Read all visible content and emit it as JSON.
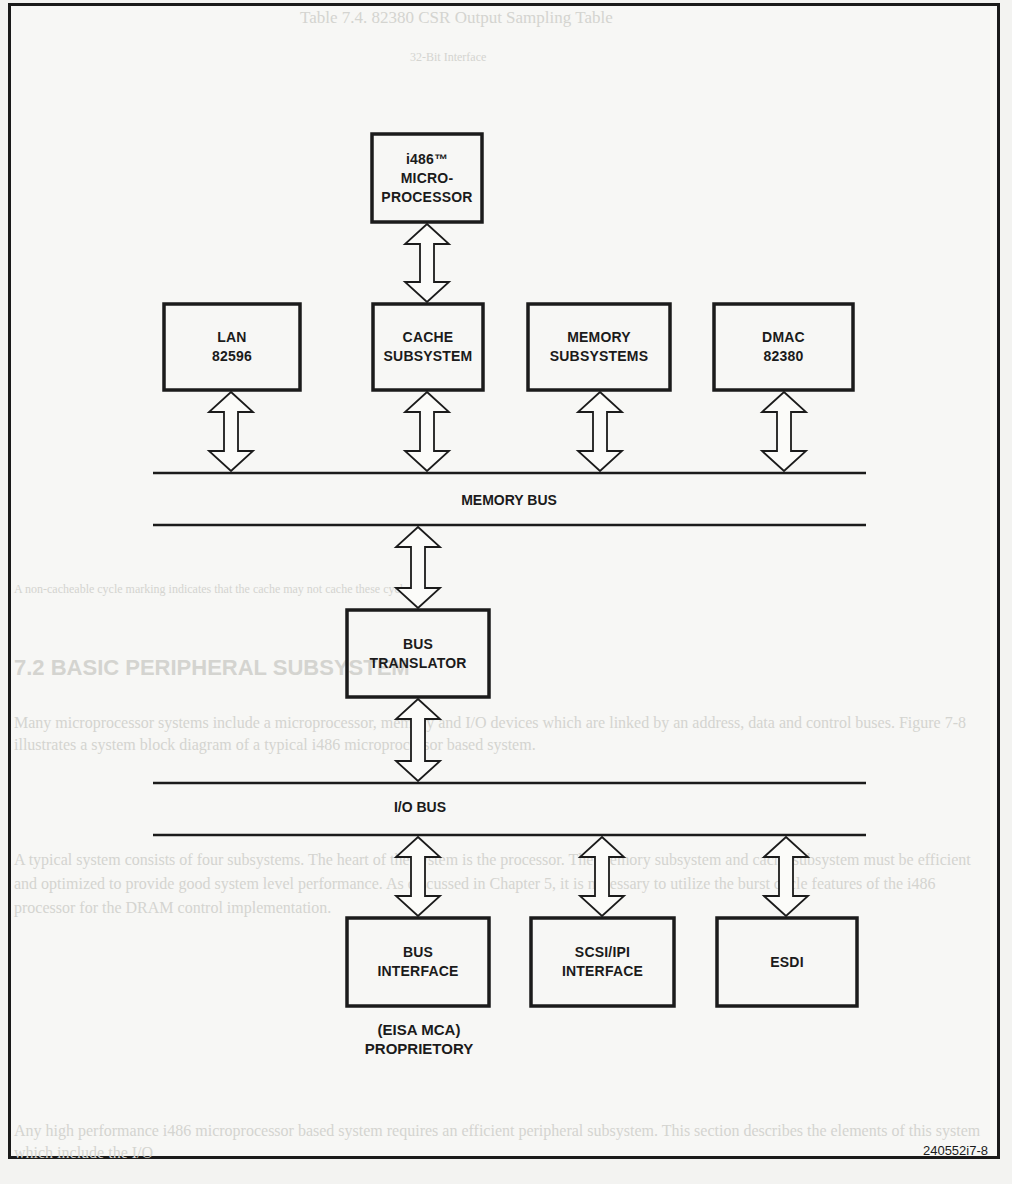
{
  "figure": {
    "id_label": "240552i7-8",
    "colors": {
      "ink": "#1b1b1b",
      "paper": "#f7f7f5",
      "bleed_through": "#d4d4d0"
    }
  },
  "blocks": {
    "cpu": {
      "lines": [
        "i486™",
        "MICRO-",
        "PROCESSOR"
      ]
    },
    "lan": {
      "lines": [
        "LAN",
        "82596"
      ]
    },
    "cache": {
      "lines": [
        "CACHE",
        "SUBSYSTEM"
      ]
    },
    "memory": {
      "lines": [
        "MEMORY",
        "SUBSYSTEMS"
      ]
    },
    "dmac": {
      "lines": [
        "DMAC",
        "82380"
      ]
    },
    "bus_translator": {
      "lines": [
        "BUS",
        "TRANSLATOR"
      ]
    },
    "bus_interface": {
      "lines": [
        "BUS",
        "INTERFACE"
      ],
      "caption": [
        "(EISA MCA)",
        "PROPRIETORY"
      ]
    },
    "scsi": {
      "lines": [
        "SCSI/IPI",
        "INTERFACE"
      ]
    },
    "esdi": {
      "lines": [
        "ESDI"
      ]
    }
  },
  "buses": {
    "memory_bus": {
      "label": "MEMORY BUS"
    },
    "io_bus": {
      "label": "I/O BUS"
    }
  },
  "connections": [
    {
      "from": "cpu",
      "to": "cache",
      "type": "bidirectional"
    },
    {
      "from": "lan",
      "to": "memory_bus",
      "type": "bidirectional"
    },
    {
      "from": "cache",
      "to": "memory_bus",
      "type": "bidirectional"
    },
    {
      "from": "memory",
      "to": "memory_bus",
      "type": "bidirectional"
    },
    {
      "from": "dmac",
      "to": "memory_bus",
      "type": "bidirectional"
    },
    {
      "from": "memory_bus",
      "to": "bus_translator",
      "type": "bidirectional"
    },
    {
      "from": "bus_translator",
      "to": "io_bus",
      "type": "bidirectional"
    },
    {
      "from": "io_bus",
      "to": "bus_interface",
      "type": "bidirectional"
    },
    {
      "from": "io_bus",
      "to": "scsi",
      "type": "bidirectional"
    },
    {
      "from": "io_bus",
      "to": "esdi",
      "type": "bidirectional"
    }
  ],
  "bleed_through": {
    "title": "Table 7.4. 82380 CSR Output Sampling Table",
    "header": "32-Bit Interface",
    "section": "7.2 BASIC PERIPHERAL SUBSYSTEM",
    "footnote": "A non-cacheable cycle marking indicates that the cache may not cache these cycles.",
    "para1": "Many microprocessor systems include a microprocessor, memory and I/O devices which are linked by an address, data and control buses. Figure 7-8 illustrates a system block diagram of a typical i486 microprocessor based system.",
    "para2": "A typical system consists of four subsystems. The heart of the system is the processor. The memory subsystem and cache subsystem must be efficient and optimized to provide good system level performance. As discussed in Chapter 5, it is necessary to utilize the burst cycle features of the i486 processor for the DRAM control implementation.",
    "para3": "Any high performance i486 microprocessor based system requires an efficient peripheral subsystem. This section describes the elements of this system which include the I/O"
  }
}
